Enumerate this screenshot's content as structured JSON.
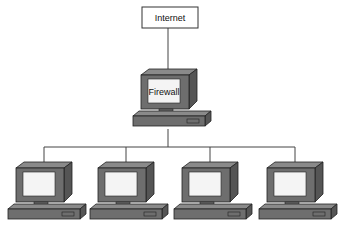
{
  "diagram": {
    "type": "network-topology",
    "nodes": [
      {
        "id": "internet",
        "label": "Internet",
        "shape": "box"
      },
      {
        "id": "firewall",
        "label": "Firewall",
        "shape": "computer"
      },
      {
        "id": "pc1",
        "label": "",
        "shape": "computer"
      },
      {
        "id": "pc2",
        "label": "",
        "shape": "computer"
      },
      {
        "id": "pc3",
        "label": "",
        "shape": "computer"
      },
      {
        "id": "pc4",
        "label": "",
        "shape": "computer"
      }
    ],
    "edges": [
      [
        "internet",
        "firewall"
      ],
      [
        "firewall",
        "pc1"
      ],
      [
        "firewall",
        "pc2"
      ],
      [
        "firewall",
        "pc3"
      ],
      [
        "firewall",
        "pc4"
      ]
    ],
    "colors": {
      "monitor_front": "#6e6e6e",
      "monitor_top": "#8a8a8a",
      "monitor_side": "#555555",
      "screen": "#f4f4f4",
      "line": "#444444"
    }
  },
  "labels": {
    "internet": "Internet",
    "firewall": "Firewall"
  }
}
